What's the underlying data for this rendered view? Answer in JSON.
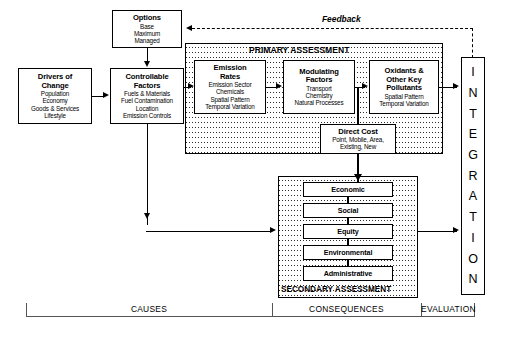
{
  "diagram": {
    "feedback_label": "Feedback",
    "regions": {
      "primary": "PRIMARY ASSESSMENT",
      "secondary": "SECONDARY ASSESSMENT"
    },
    "integration_label": "INTEGRATION",
    "integration_letters": [
      "I",
      "N",
      "T",
      "E",
      "G",
      "R",
      "A",
      "T",
      "I",
      "O",
      "N"
    ]
  },
  "boxes": {
    "options": {
      "title": "Options",
      "lines": [
        "Base",
        "Maximum",
        "Managed"
      ]
    },
    "drivers": {
      "title_line1": "Drivers of",
      "title_line2": "Change",
      "lines": [
        "Population",
        "Economy",
        "Goods & Services",
        "Lifestyle"
      ]
    },
    "controllable": {
      "title_line1": "Controllable",
      "title_line2": "Factors",
      "lines": [
        "Fuels & Materials",
        "Fuel Contamination",
        "Location",
        "Emission Controls"
      ]
    },
    "emission": {
      "title_line1": "Emission",
      "title_line2": "Rates",
      "lines": [
        "Emission Sector",
        "Chemicals",
        "Spatial Pattern",
        "Temporal Variation"
      ]
    },
    "modulating": {
      "title_line1": "Modulating",
      "title_line2": "Factors",
      "lines": [
        "Transport",
        "Chemistry",
        "Natural Processes"
      ]
    },
    "oxidants": {
      "title_line1": "Oxidants &",
      "title_line2": "Other Key",
      "title_line3": "Pollutants",
      "lines": [
        "Spatial Pattern",
        "Temporal Variation"
      ]
    },
    "direct_cost": {
      "title": "Direct Cost",
      "lines": [
        "Point, Mobile, Area,",
        "Existing, New"
      ]
    }
  },
  "secondary_items": [
    {
      "label": "Economic"
    },
    {
      "label": "Social"
    },
    {
      "label": "Equity"
    },
    {
      "label": "Environmental"
    },
    {
      "label": "Administrative"
    }
  ],
  "bottom_bracket": {
    "causes": "CAUSES",
    "consequences": "CONSEQUENCES",
    "evaluation": "EVALUATION"
  },
  "colors": {
    "ink": "#000000",
    "paper": "#ffffff",
    "bracket": "#555555"
  }
}
